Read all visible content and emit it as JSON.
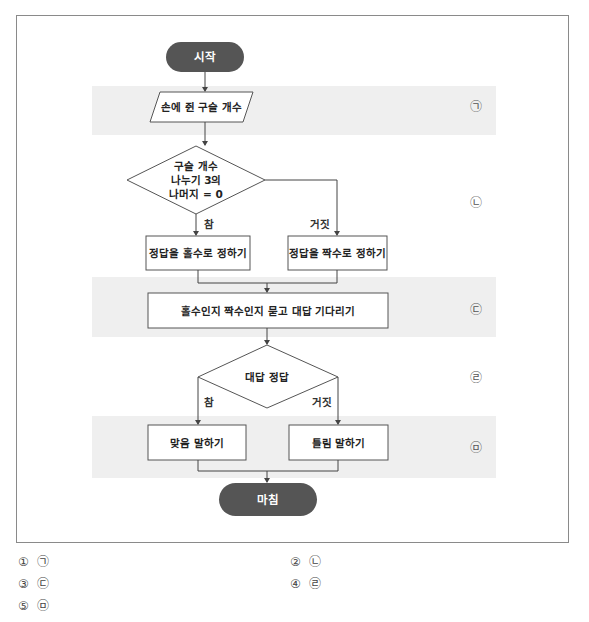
{
  "flowchart": {
    "start": "시작",
    "input": "손에 쥔 구슬 개수",
    "decision1": {
      "lines": [
        "구슬 개수",
        "나누기 3의",
        "나머지 = 0"
      ],
      "true_label": "참",
      "false_label": "거짓"
    },
    "process_true1": "정답을 홀수로 정하기",
    "process_false1": "정답을 짝수로 정하기",
    "ask": "홀수인지 짝수인지 묻고 대답 기다리기",
    "decision2": {
      "text": "대답 정답",
      "true_label": "참",
      "false_label": "거짓"
    },
    "process_true2": "맞음 말하기",
    "process_false2": "틀림 말하기",
    "end": "마침",
    "markers": [
      "㉠",
      "㉡",
      "㉢",
      "㉣",
      "㉤"
    ]
  },
  "choices": [
    {
      "num": "①",
      "label": "㉠"
    },
    {
      "num": "②",
      "label": "㉡"
    },
    {
      "num": "③",
      "label": "㉢"
    },
    {
      "num": "④",
      "label": "㉣"
    },
    {
      "num": "⑤",
      "label": "㉤"
    }
  ],
  "colors": {
    "terminal_fill": "#555555",
    "band_fill": "#efefef",
    "line": "#444444"
  }
}
